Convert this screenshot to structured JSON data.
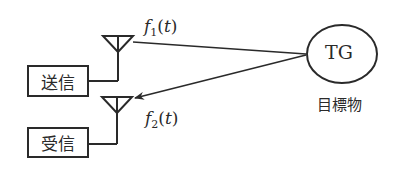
{
  "diagram": {
    "transmitter": {
      "label": "送信"
    },
    "receiver": {
      "label": "受信"
    },
    "signal_out": {
      "symbol": "f",
      "subscript": "1",
      "open": "(",
      "var": "t",
      "close": ")"
    },
    "signal_in": {
      "symbol": "f",
      "subscript": "2",
      "open": "(",
      "var": "t",
      "close": ")"
    },
    "target": {
      "abbr": "TG",
      "caption": "目標物"
    },
    "colors": {
      "stroke": "#2a2a2a",
      "background": "#ffffff"
    }
  }
}
